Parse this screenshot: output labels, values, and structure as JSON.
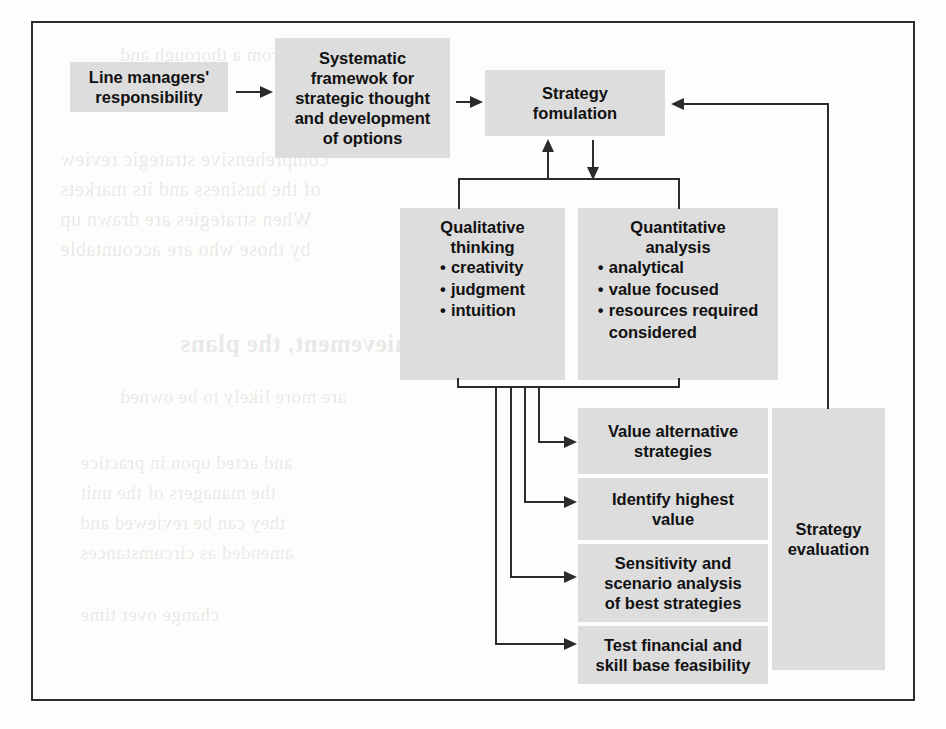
{
  "diagram": {
    "colors": {
      "box_fill": "#dddddd",
      "line": "#2b2b2b",
      "frame": "#2b2b2b",
      "text": "#111111",
      "page": "#fdfdfc"
    },
    "boxes": {
      "line_managers": {
        "line1": "Line managers'",
        "line2": "responsibility"
      },
      "systematic_framework": {
        "line1": "Systematic",
        "line2": "framewok for",
        "line3": "strategic thought",
        "line4": "and development",
        "line5": "of options"
      },
      "strategy_formulation": {
        "line1": "Strategy",
        "line2": "fomulation"
      },
      "qualitative_thinking": {
        "line1": "Qualitative",
        "line2": "thinking",
        "bullets": [
          "creativity",
          "judgment",
          "intuition"
        ]
      },
      "quantitative_analysis": {
        "line1": "Quantitative",
        "line2": "analysis",
        "bullets": [
          "analytical",
          "value focused",
          "resources required"
        ],
        "bullet_continuation": "considered"
      },
      "value_alternative": {
        "line1": "Value alternative",
        "line2": "strategies"
      },
      "identify_highest": {
        "line1": "Identify highest",
        "line2": "value"
      },
      "sensitivity_scenario": {
        "line1": "Sensitivity and",
        "line2": "scenario analysis",
        "line3": "of best strategies"
      },
      "test_feasibility": {
        "line1": "Test financial and",
        "line2": "skill base feasibility"
      },
      "strategy_evaluation": {
        "line1": "Strategy",
        "line2": "evaluation"
      }
    },
    "bleed_text": {
      "l1": "Results from a thorough and",
      "l2": "comprehensive strategic review",
      "l3": "of the business and its markets",
      "l4": "When strategies are drawn up",
      "l5": "by those who are accountable",
      "l6": "for their achievement, the plans",
      "l7": "are more likely to be owned",
      "l8": "and acted upon in practice",
      "l9": "the managers of the unit",
      "l10": "they can be reviewed and",
      "l11": "amended as circumstances",
      "l12": "change over time"
    }
  }
}
